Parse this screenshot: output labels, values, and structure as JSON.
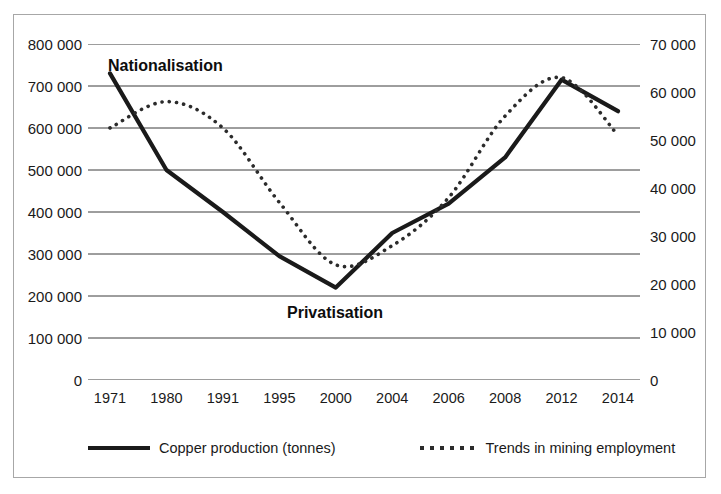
{
  "chart_data": {
    "type": "line",
    "title": "",
    "subtitle": "",
    "xlabel": "",
    "ylabel": "",
    "grid": true,
    "legend_position": "bottom",
    "categories": [
      "1971",
      "1980",
      "1991",
      "1995",
      "2000",
      "2004",
      "2006",
      "2008",
      "2012",
      "2014"
    ],
    "axes": {
      "left": {
        "label": "",
        "ylim": [
          0,
          800000
        ],
        "tick_step": 100000,
        "ticks": [
          800000,
          700000,
          600000,
          500000,
          400000,
          300000,
          200000,
          100000,
          0
        ],
        "tick_labels": [
          "800 000",
          "700 000",
          "600 000",
          "500 000",
          "400 000",
          "300 000",
          "200 000",
          "100 000",
          "0"
        ]
      },
      "right": {
        "label": "",
        "ylim": [
          0,
          70000
        ],
        "tick_step": 10000,
        "ticks": [
          70000,
          60000,
          50000,
          40000,
          30000,
          20000,
          10000,
          0
        ],
        "tick_labels": [
          "70 000",
          "60 000",
          "50 000",
          "40 000",
          "30 000",
          "20 000",
          "10 000",
          "0"
        ]
      }
    },
    "series": [
      {
        "name": "Copper production (tonnes)",
        "style": "solid",
        "axis": "left",
        "color": "#1a1a1a",
        "values": [
          730000,
          500000,
          400000,
          295000,
          220000,
          350000,
          420000,
          530000,
          715000,
          640000
        ]
      },
      {
        "name": "Trends in mining employment",
        "style": "dotted",
        "axis": "right",
        "color": "#2b2b2b",
        "values": [
          52500,
          58000,
          52500,
          37000,
          24000,
          28000,
          38000,
          55000,
          63000,
          51000
        ]
      }
    ],
    "annotations": [
      {
        "text": "Nationalisation",
        "near_category": "1971"
      },
      {
        "text": "Privatisation",
        "near_category": "2000"
      }
    ]
  },
  "legend": {
    "items": [
      {
        "label": "Copper production (tonnes)",
        "marker": "solid-line-swatch"
      },
      {
        "label": "Trends in mining employment",
        "marker": "dotted-line-swatch"
      }
    ]
  }
}
